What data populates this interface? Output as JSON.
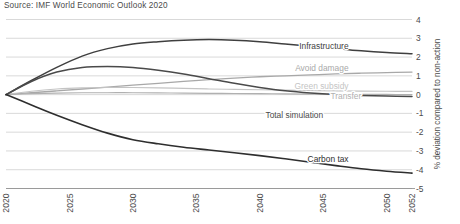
{
  "source": {
    "text": "Source: IMF World Economic Outlook 2020"
  },
  "chart_data": {
    "type": "line",
    "title": "",
    "subtitle": "",
    "source": "Source: IMF World Economic Outlook 2020",
    "xlabel": "",
    "ylabel": "% deviation compared to non-action",
    "xlim": [
      2020,
      2052
    ],
    "ylim": [
      -5,
      4
    ],
    "yticks": [
      4,
      3,
      2,
      1,
      0,
      -1,
      -2,
      -3,
      -4,
      -5
    ],
    "ytick_labels": [
      "4",
      "3",
      "2",
      "1",
      "0",
      "-1",
      "-2",
      "-3",
      "-4",
      "-5"
    ],
    "xticks": [
      2020,
      2025,
      2030,
      2035,
      2040,
      2045,
      2050,
      2052
    ],
    "xtick_labels": [
      "2020",
      "2025",
      "2030",
      "2035",
      "2040",
      "2045",
      "2050",
      "2052"
    ],
    "xtick_rotation": 90,
    "grid": "horizontal",
    "legend": "inline-right-labels",
    "x": [
      2020,
      2022,
      2024,
      2026,
      2028,
      2030,
      2032,
      2034,
      2036,
      2038,
      2040,
      2042,
      2044,
      2046,
      2048,
      2050,
      2052
    ],
    "series": [
      {
        "name": "Infrastructure",
        "color": "#3f3f3f",
        "width": 1.5,
        "label_x": 2047,
        "label_y": 2.45,
        "values": [
          0,
          0.75,
          1.45,
          2.05,
          2.45,
          2.7,
          2.82,
          2.9,
          2.93,
          2.9,
          2.82,
          2.7,
          2.58,
          2.45,
          2.33,
          2.24,
          2.18
        ]
      },
      {
        "name": "Avoid damage",
        "color": "#a8a8a8",
        "width": 1.3,
        "label_x": 2047,
        "label_y": 1.25,
        "values": [
          0,
          0.1,
          0.2,
          0.3,
          0.4,
          0.5,
          0.6,
          0.7,
          0.8,
          0.88,
          0.95,
          1.0,
          1.05,
          1.1,
          1.14,
          1.17,
          1.2
        ]
      },
      {
        "name": "Green subsidy",
        "color": "#c4c4c4",
        "width": 1.2,
        "label_x": 2047,
        "label_y": 0.32,
        "values": [
          0,
          0.18,
          0.3,
          0.36,
          0.38,
          0.38,
          0.36,
          0.33,
          0.3,
          0.28,
          0.26,
          0.24,
          0.22,
          0.2,
          0.19,
          0.18,
          0.17
        ]
      },
      {
        "name": "Transfer",
        "color": "#b0b0b0",
        "width": 1.2,
        "label_x": 2048,
        "label_y": -0.22,
        "values": [
          0,
          0.05,
          0.08,
          0.1,
          0.1,
          0.1,
          0.09,
          0.08,
          0.07,
          0.06,
          0.05,
          0.04,
          0.03,
          0.02,
          0.02,
          0.01,
          0.0
        ]
      },
      {
        "name": "Total simulation",
        "color": "#4a4a4a",
        "width": 1.5,
        "label_x": 2045,
        "label_y": -1.25,
        "values": [
          0,
          0.7,
          1.2,
          1.45,
          1.5,
          1.45,
          1.3,
          1.1,
          0.85,
          0.6,
          0.38,
          0.2,
          0.08,
          0.0,
          -0.05,
          -0.08,
          -0.1
        ]
      },
      {
        "name": "Carbon tax",
        "color": "#2e2e2e",
        "width": 1.6,
        "label_x": 2047,
        "label_y": -3.6,
        "values": [
          0,
          -0.55,
          -1.1,
          -1.6,
          -2.05,
          -2.4,
          -2.62,
          -2.8,
          -2.95,
          -3.1,
          -3.25,
          -3.42,
          -3.6,
          -3.78,
          -3.95,
          -4.08,
          -4.18
        ]
      }
    ]
  }
}
